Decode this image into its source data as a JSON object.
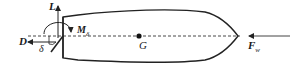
{
  "diagram": {
    "type": "free-body diagram of a fish-shaped body with control surface",
    "colors": {
      "stroke": "#222222",
      "axis": "#333333",
      "background": "#ffffff"
    },
    "labels": {
      "lift": "L",
      "drag": "D",
      "moment": "M",
      "moment_sub": "δ",
      "deflection": "δ",
      "center_of_gravity": "G",
      "thrust": "F",
      "thrust_sub": "w"
    }
  }
}
